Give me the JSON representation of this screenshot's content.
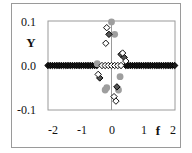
{
  "chart_data": {
    "type": "scatter",
    "title": "",
    "xlabel": "f",
    "ylabel": "Y",
    "xlim": [
      -2,
      2
    ],
    "ylim": [
      -0.1,
      0.1
    ],
    "x_ticks": [
      "-2",
      "-1",
      "0",
      "1",
      "2"
    ],
    "y_ticks": [
      "0.1",
      "0.0",
      "-0.1"
    ],
    "grid": false,
    "legend": null,
    "series": [
      {
        "name": "dark-filled-diamonds",
        "marker": "diamond",
        "color": "#1a1a1a",
        "note": "dense row at Y=0 for |f| >= ~0.45",
        "points": [
          [
            -0.08,
            0.07
          ],
          [
            0.3,
            0.025
          ],
          [
            0.4,
            0.018
          ],
          [
            0.17,
            -0.048
          ],
          [
            -0.37,
            -0.028
          ]
        ]
      },
      {
        "name": "open-diamonds",
        "marker": "diamond-open",
        "color": "#111111",
        "points": [
          [
            -0.15,
            0.085
          ],
          [
            -0.18,
            0.05
          ],
          [
            0.35,
            0.028
          ],
          [
            0.45,
            0.01
          ],
          [
            -0.42,
            -0.02
          ],
          [
            0.08,
            -0.07
          ],
          [
            0.14,
            -0.08
          ],
          [
            -0.3,
            0.0
          ],
          [
            -0.2,
            0.0
          ],
          [
            -0.1,
            0.0
          ],
          [
            0.0,
            0.0
          ],
          [
            0.1,
            0.0
          ],
          [
            0.2,
            0.0
          ],
          [
            0.3,
            0.0
          ]
        ]
      },
      {
        "name": "gray-circles",
        "marker": "circle",
        "color": "#9e9e9e",
        "points": [
          [
            0.0,
            0.098
          ],
          [
            0.1,
            0.07
          ],
          [
            -0.45,
            0.004
          ],
          [
            0.27,
            -0.025
          ],
          [
            -0.15,
            -0.05
          ],
          [
            -0.2,
            -0.055
          ],
          [
            0.22,
            -0.055
          ]
        ]
      }
    ]
  }
}
